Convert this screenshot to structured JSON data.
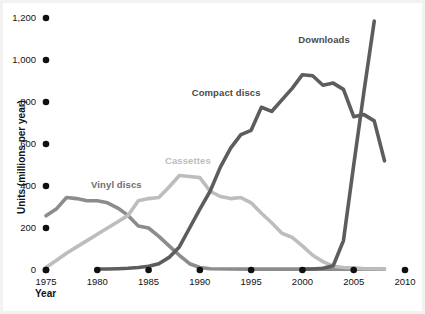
{
  "chart_data": {
    "type": "line",
    "title": "",
    "subtitle": "",
    "xlabel": "Year",
    "ylabel": "Units (millions per year)",
    "xlim": [
      1975,
      2010
    ],
    "ylim": [
      0,
      1200
    ],
    "grid": false,
    "legend_position": "inline-labels",
    "xticks": [
      "1975",
      "1980",
      "1985",
      "1990",
      "1995",
      "2000",
      "2005",
      "2010"
    ],
    "xtick_values": [
      1975,
      1980,
      1985,
      1990,
      1995,
      2000,
      2005,
      2010
    ],
    "ytick_labels": [
      "0",
      "200",
      "400",
      "600",
      "800",
      "1,000",
      "1,200"
    ],
    "ytick_values": [
      0,
      200,
      400,
      600,
      800,
      1000,
      1200
    ],
    "tick_marker_style": "filled-circle",
    "series": [
      {
        "name": "Vinyl discs",
        "color": "#8c8c8c",
        "label_color": "#6e6e6e",
        "label_x": 1979.4,
        "label_y": 405,
        "x": [
          1975,
          1976,
          1977,
          1978,
          1979,
          1980,
          1981,
          1982,
          1983,
          1984,
          1985,
          1986,
          1987,
          1988,
          1989,
          1990,
          1991,
          1995,
          2000,
          2005,
          2008
        ],
        "values": [
          258,
          290,
          345,
          340,
          330,
          330,
          320,
          295,
          260,
          210,
          200,
          160,
          115,
          70,
          30,
          12,
          6,
          4,
          4,
          4,
          4
        ]
      },
      {
        "name": "Cassettes",
        "color": "#bdbdbd",
        "label_color": "#bdbdbd",
        "label_x": 1986.6,
        "label_y": 520,
        "x": [
          1975,
          1976,
          1977,
          1978,
          1979,
          1980,
          1981,
          1982,
          1983,
          1984,
          1985,
          1986,
          1987,
          1988,
          1989,
          1990,
          1991,
          1992,
          1993,
          1994,
          1995,
          1996,
          1997,
          1998,
          1999,
          2000,
          2001,
          2002,
          2003,
          2004,
          2005,
          2006,
          2008
        ],
        "values": [
          12,
          45,
          80,
          110,
          140,
          170,
          200,
          230,
          260,
          330,
          340,
          345,
          395,
          450,
          445,
          440,
          375,
          350,
          340,
          345,
          320,
          270,
          225,
          175,
          155,
          115,
          70,
          40,
          18,
          12,
          10,
          6,
          5
        ]
      },
      {
        "name": "Compact discs",
        "color": "#5d5d5d",
        "label_color": "#4a4a4a",
        "label_x": 1989.2,
        "label_y": 845,
        "x": [
          1980,
          1981,
          1982,
          1983,
          1984,
          1985,
          1986,
          1987,
          1988,
          1989,
          1990,
          1991,
          1992,
          1993,
          1994,
          1995,
          1996,
          1997,
          1998,
          1999,
          2000,
          2001,
          2002,
          2003,
          2004,
          2005,
          2006,
          2007,
          2008
        ],
        "values": [
          5,
          5,
          6,
          8,
          12,
          18,
          30,
          60,
          110,
          200,
          290,
          375,
          490,
          580,
          645,
          665,
          775,
          755,
          810,
          865,
          930,
          925,
          880,
          890,
          860,
          730,
          740,
          710,
          520
        ]
      },
      {
        "name": "Downloads",
        "color": "#5d5d5d",
        "label_color": "#4a4a4a",
        "label_x": 1999.6,
        "label_y": 1095,
        "x": [
          2000,
          2001,
          2002,
          2003,
          2004,
          2005,
          2006,
          2007
        ],
        "values": [
          4,
          5,
          8,
          20,
          140,
          500,
          850,
          1185
        ]
      }
    ]
  }
}
